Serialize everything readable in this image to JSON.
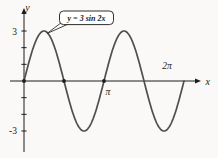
{
  "figure": {
    "equation_label": "y = 3 sin 2x",
    "axis_labels": {
      "x": "x",
      "y": "y"
    },
    "tick_labels": {
      "y_top": "3",
      "y_bottom": "-3",
      "x_pi": "π",
      "x_2pi": "2π"
    }
  },
  "chart_data": {
    "type": "line",
    "title": "y = 3 sin 2x",
    "function": "y = 3*sin(2*x)",
    "amplitude": 3,
    "frequency": 2,
    "x_range_rad": [
      0,
      6.2832
    ],
    "ylim": [
      -3,
      3
    ],
    "xlabel": "x",
    "ylabel": "y",
    "grid": false,
    "x_tick_labels": [
      {
        "value": 3.1416,
        "label": "π"
      },
      {
        "value": 6.2832,
        "label": "2π"
      }
    ],
    "y_tick_values": [
      -3,
      -2,
      -1,
      1,
      2,
      3
    ],
    "y_tick_labeled": [
      3,
      -3
    ],
    "marked_points_x_rad": [
      0,
      1.5708,
      3.1416
    ],
    "key_points": [
      {
        "x": 0.0,
        "y": 0
      },
      {
        "x": 0.7854,
        "y": 3
      },
      {
        "x": 1.5708,
        "y": 0
      },
      {
        "x": 2.3562,
        "y": -3
      },
      {
        "x": 3.1416,
        "y": 0
      },
      {
        "x": 3.927,
        "y": 3
      },
      {
        "x": 4.7124,
        "y": 0
      },
      {
        "x": 5.4978,
        "y": -3
      },
      {
        "x": 6.2832,
        "y": 0
      }
    ],
    "annotation": {
      "text": "y = 3 sin 2x",
      "points_to": {
        "x": 0.7854,
        "y": 3
      }
    },
    "colors": {
      "curve": "#4f4f4f",
      "axis": "#1c1c1c",
      "text": "#1c1c1c",
      "callout_bg": "#fffffe",
      "callout_border": "#2e2e2e",
      "background": "#faf9f7"
    }
  }
}
